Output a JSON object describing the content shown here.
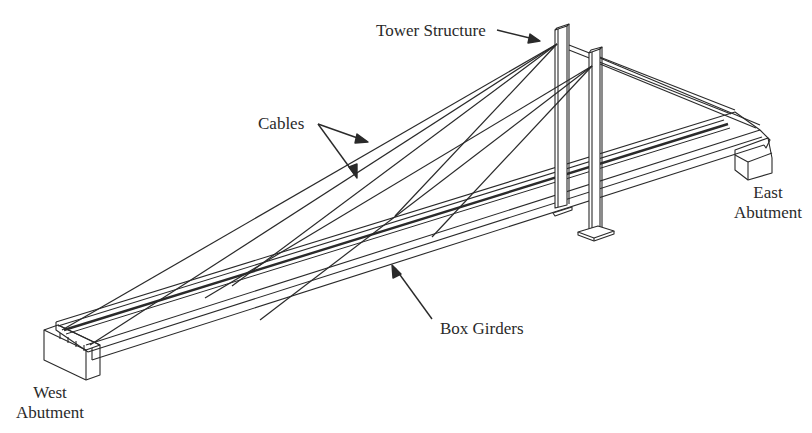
{
  "diagram": {
    "type": "cable-stayed bridge isometric line drawing",
    "labels": {
      "tower": "Tower Structure",
      "cables": "Cables",
      "east_abutment_line1": "East",
      "east_abutment_line2": "Abutment",
      "west_abutment_line1": "West",
      "west_abutment_line2": "Abutment",
      "box_girders": "Box Girders"
    },
    "colors": {
      "line": "#2a2a2a",
      "background": "#ffffff",
      "text": "#2a2a2a"
    }
  }
}
